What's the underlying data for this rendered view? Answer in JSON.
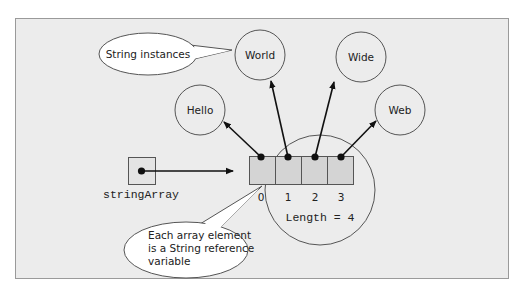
{
  "colors": {
    "frame_bg": "#ececec",
    "frame_border": "#9a9a9a",
    "stroke": "#444444",
    "cell_fill": "#d4d4d4",
    "bubble_fill": "#ffffff"
  },
  "callouts": {
    "string_instances": "String instances",
    "element_note": [
      "Each array element",
      "is a String reference",
      "variable"
    ]
  },
  "strings": [
    {
      "label": "Hello"
    },
    {
      "label": "World"
    },
    {
      "label": "Wide"
    },
    {
      "label": "Web"
    }
  ],
  "variable": {
    "name": "stringArray"
  },
  "array": {
    "indices": [
      "0",
      "1",
      "2",
      "3"
    ],
    "length_label": "Length = 4"
  }
}
